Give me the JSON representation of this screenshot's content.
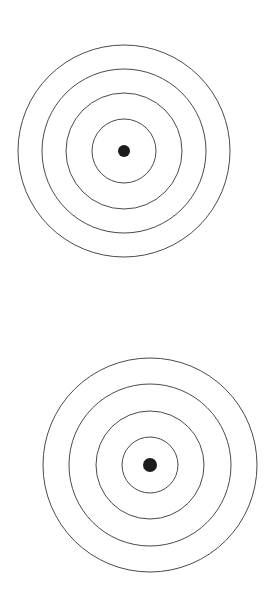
{
  "page": {
    "title": "Concentric Circle Targets",
    "background_color": "#ffffff",
    "width": 264,
    "height": 593
  },
  "style": {
    "ring_stroke_color": "#4a4a4a",
    "ring_stroke_width": 1,
    "ring_fill": "none",
    "dot_fill_color": "#1c1c1c"
  },
  "targets": [
    {
      "name": "upper-target",
      "label": "Upper concentric circle target",
      "center_x": 124,
      "center_y": 151,
      "dot_radius": 6,
      "rings": [
        {
          "index": 1,
          "radius": 106
        },
        {
          "index": 2,
          "radius": 82
        },
        {
          "index": 3,
          "radius": 58
        },
        {
          "index": 4,
          "radius": 32
        }
      ]
    },
    {
      "name": "lower-target",
      "label": "Lower concentric circle target",
      "center_x": 150,
      "center_y": 465,
      "dot_radius": 7,
      "rings": [
        {
          "index": 1,
          "radius": 107
        },
        {
          "index": 2,
          "radius": 81
        },
        {
          "index": 3,
          "radius": 54
        },
        {
          "index": 4,
          "radius": 28
        }
      ]
    }
  ],
  "chart_data": {
    "type": "scatter",
    "title": "Concentric Circle Targets",
    "xlabel": "",
    "ylabel": "",
    "xlim": [
      0,
      264
    ],
    "ylim": [
      0,
      593
    ],
    "grid": false,
    "legend_position": "none",
    "series": [
      {
        "name": "upper-target-rings",
        "x": [
          124,
          124,
          124,
          124,
          124
        ],
        "y": [
          151,
          151,
          151,
          151,
          151
        ],
        "radii": [
          106,
          82,
          58,
          32,
          6
        ],
        "values": [
          106,
          82,
          58,
          32,
          6
        ]
      },
      {
        "name": "lower-target-rings",
        "x": [
          150,
          150,
          150,
          150,
          150
        ],
        "y": [
          465,
          465,
          465,
          465,
          465
        ],
        "radii": [
          107,
          81,
          54,
          28,
          7
        ],
        "values": [
          107,
          81,
          54,
          28,
          7
        ]
      }
    ],
    "annotations": []
  }
}
